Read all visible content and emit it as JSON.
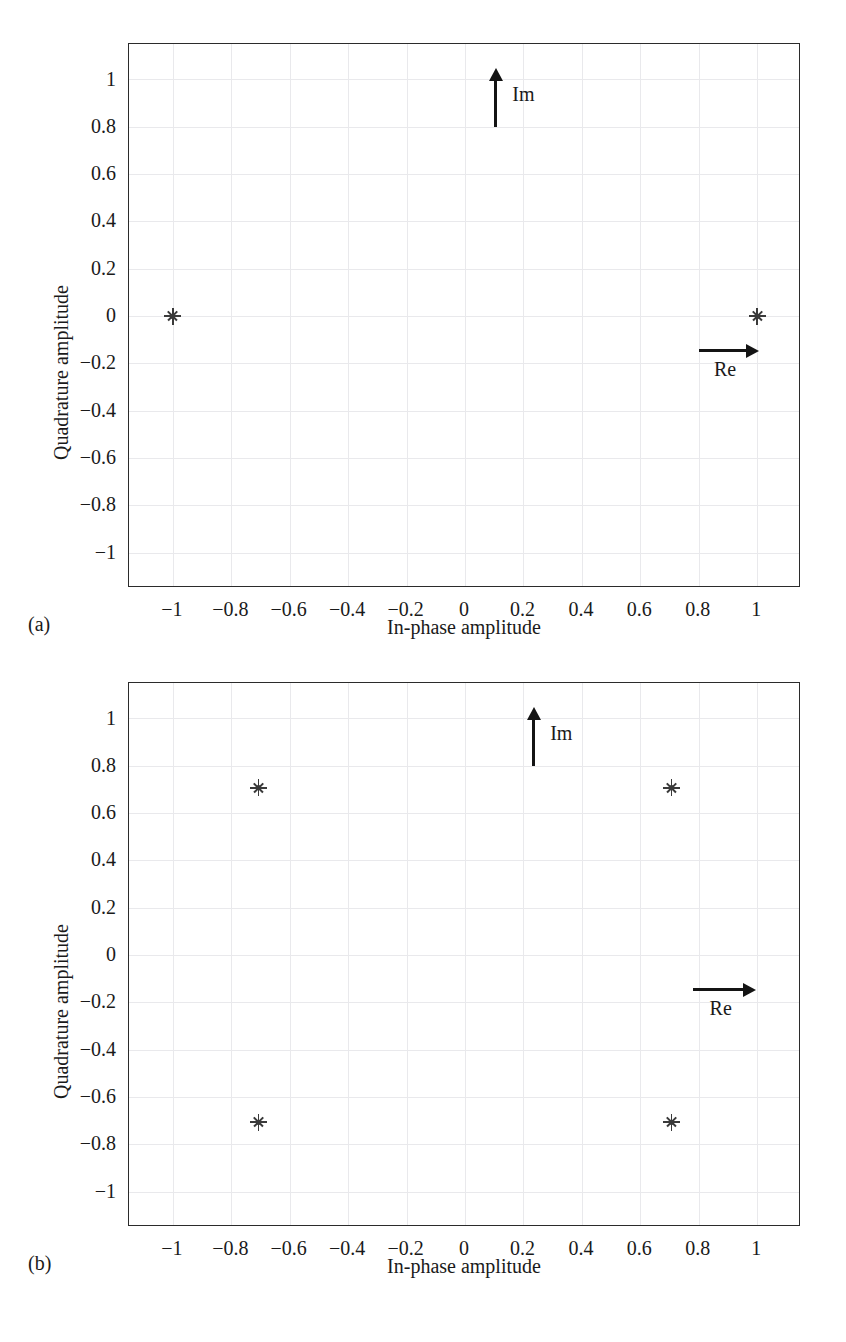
{
  "figure": {
    "panel_tags": {
      "a": "(a)",
      "b": "(b)"
    },
    "caption": ""
  },
  "chart_data": [
    {
      "id": "panel-a",
      "type": "scatter",
      "title": "",
      "panel_label": "(a)",
      "xlabel": "In-phase amplitude",
      "ylabel": "Quadrature amplitude",
      "xlim": [
        -1.15,
        1.15
      ],
      "ylim": [
        -1.15,
        1.15
      ],
      "grid": true,
      "legend": "none",
      "xticks": [
        "-1",
        "-0.8",
        "-0.6",
        "-0.4",
        "-0.2",
        "0",
        "0.2",
        "0.4",
        "0.6",
        "0.8",
        "1"
      ],
      "xtick_values": [
        -1,
        -0.8,
        -0.6,
        -0.4,
        -0.2,
        0,
        0.2,
        0.4,
        0.6,
        0.8,
        1
      ],
      "yticks": [
        "1",
        "0.8",
        "0.6",
        "0.4",
        "0.2",
        "0",
        "-0.2",
        "-0.4",
        "-0.6",
        "-0.8",
        "-1"
      ],
      "ytick_values": [
        1,
        0.8,
        0.6,
        0.4,
        0.2,
        0,
        -0.2,
        -0.4,
        -0.6,
        -0.8,
        -1
      ],
      "marker": "asterisk",
      "points": [
        {
          "x": -1,
          "y": 0
        },
        {
          "x": 1,
          "y": 0
        }
      ],
      "annotations": [
        {
          "label": "Im",
          "type": "arrow-up",
          "x": 0.1,
          "y_from": 0.8,
          "y_to": 1.05
        },
        {
          "label": "Re",
          "type": "arrow-right",
          "y": -0.14,
          "x_from": 0.8,
          "x_to": 1.0
        }
      ]
    },
    {
      "id": "panel-b",
      "type": "scatter",
      "title": "",
      "panel_label": "(b)",
      "xlabel": "In-phase amplitude",
      "ylabel": "Quadrature amplitude",
      "xlim": [
        -1.15,
        1.15
      ],
      "ylim": [
        -1.15,
        1.15
      ],
      "grid": true,
      "legend": "none",
      "xticks": [
        "-1",
        "-0.8",
        "-0.6",
        "-0.4",
        "-0.2",
        "0",
        "0.2",
        "0.4",
        "0.6",
        "0.8",
        "1"
      ],
      "xtick_values": [
        -1,
        -0.8,
        -0.6,
        -0.4,
        -0.2,
        0,
        0.2,
        0.4,
        0.6,
        0.8,
        1
      ],
      "yticks": [
        "1",
        "0.8",
        "0.6",
        "0.4",
        "0.2",
        "0",
        "-0.2",
        "-0.4",
        "-0.6",
        "-0.8",
        "-1"
      ],
      "ytick_values": [
        1,
        0.8,
        0.6,
        0.4,
        0.2,
        0,
        -0.2,
        -0.4,
        -0.6,
        -0.8,
        -1
      ],
      "marker": "asterisk",
      "points": [
        {
          "x": -0.707,
          "y": 0.707
        },
        {
          "x": 0.707,
          "y": 0.707
        },
        {
          "x": -0.707,
          "y": -0.707
        },
        {
          "x": 0.707,
          "y": -0.707
        }
      ],
      "annotations": [
        {
          "label": "Im",
          "type": "arrow-up",
          "x": 0.23,
          "y_from": 0.8,
          "y_to": 1.05
        },
        {
          "label": "Re",
          "type": "arrow-right",
          "y": -0.14,
          "x_from": 0.78,
          "x_to": 0.99
        }
      ]
    }
  ]
}
